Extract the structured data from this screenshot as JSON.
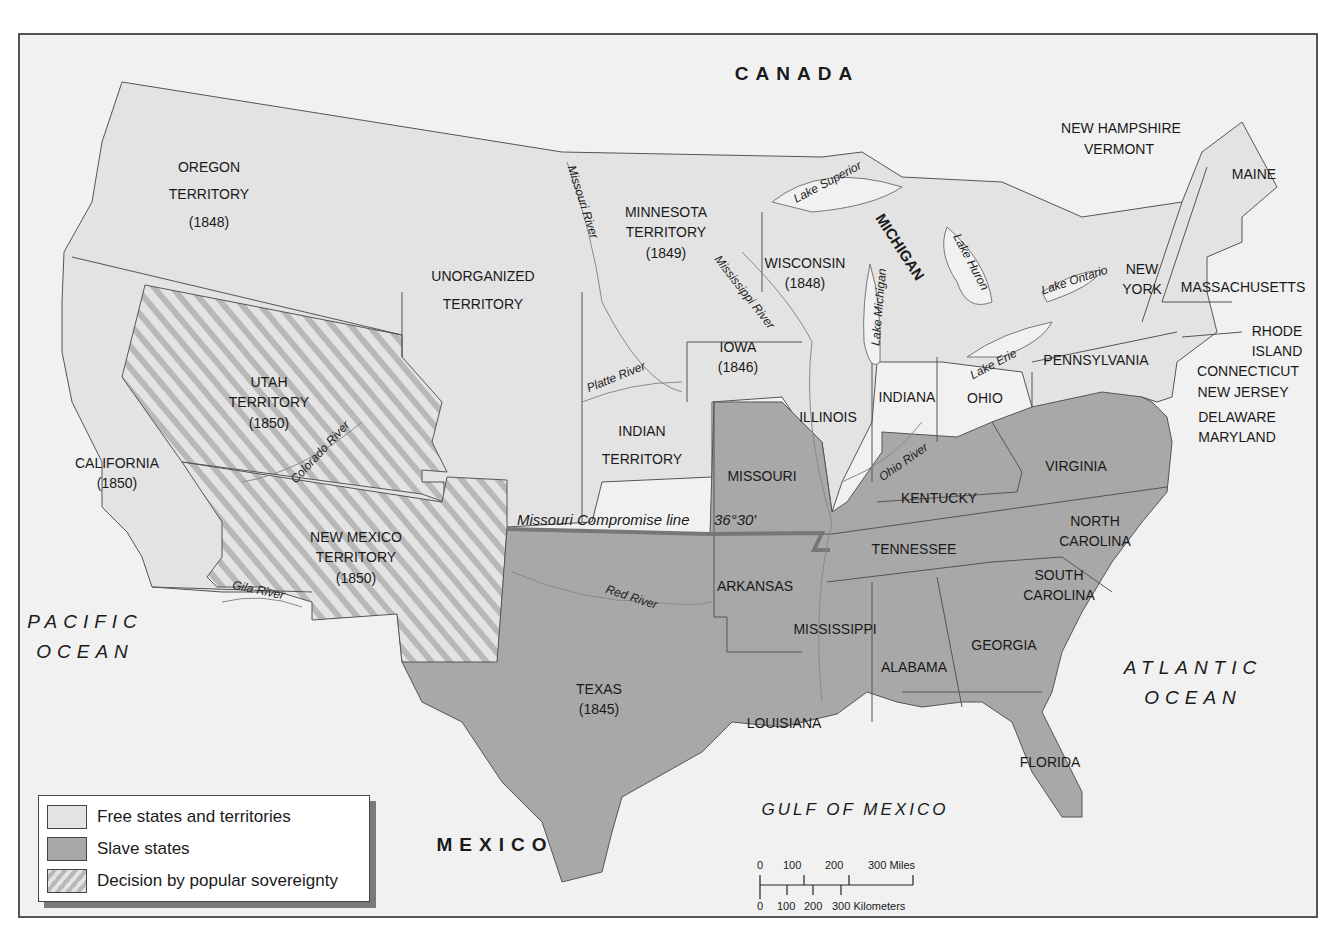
{
  "colors": {
    "free": "#e3e3e3",
    "slave": "#a8a8a8",
    "popular_sovereignty_base": "#e3e3e3",
    "popular_sovereignty_stripe": "#b5b5b5",
    "foreign_and_water": "#f1f1f1",
    "border": "#444444",
    "compromise_line": "#777777"
  },
  "countries": {
    "canada": "CANADA",
    "mexico": "MEXICO"
  },
  "water_bodies": {
    "pacific": [
      "PACIFIC",
      "OCEAN"
    ],
    "atlantic": [
      "ATLANTIC",
      "OCEAN"
    ],
    "gulf": "GULF OF MEXICO"
  },
  "regions": {
    "oregon": {
      "name": "OREGON",
      "line2": "TERRITORY",
      "year": "(1848)",
      "status": "free"
    },
    "unorganized": {
      "name": "UNORGANIZED",
      "line2": "TERRITORY",
      "status": "free"
    },
    "minnesota": {
      "name": "MINNESOTA",
      "line2": "TERRITORY",
      "year": "(1849)",
      "status": "free"
    },
    "wisconsin": {
      "name": "WISCONSIN",
      "year": "(1848)",
      "status": "free"
    },
    "michigan": {
      "name": "MICHIGAN",
      "status": "free"
    },
    "iowa": {
      "name": "IOWA",
      "year": "(1846)",
      "status": "free"
    },
    "utah": {
      "name": "UTAH",
      "line2": "TERRITORY",
      "year": "(1850)",
      "status": "popular_sovereignty"
    },
    "new_mexico": {
      "name": "NEW MEXICO",
      "line2": "TERRITORY",
      "year": "(1850)",
      "status": "popular_sovereignty"
    },
    "california": {
      "name": "CALIFORNIA",
      "year": "(1850)",
      "status": "free"
    },
    "indian": {
      "name": "INDIAN",
      "line2": "TERRITORY",
      "status": "free"
    },
    "illinois": {
      "name": "ILLINOIS",
      "status": "free"
    },
    "indiana": {
      "name": "INDIANA",
      "status": "free"
    },
    "ohio": {
      "name": "OHIO",
      "status": "free"
    },
    "pennsylvania": {
      "name": "PENNSYLVANIA",
      "status": "free"
    },
    "new_york": {
      "name": "NEW",
      "line2": "YORK",
      "status": "free"
    },
    "new_hampshire": {
      "name": "NEW HAMPSHIRE",
      "status": "free"
    },
    "vermont": {
      "name": "VERMONT",
      "status": "free"
    },
    "maine": {
      "name": "MAINE",
      "status": "free"
    },
    "massachusetts": {
      "name": "MASSACHUSETTS",
      "status": "free"
    },
    "rhode_island": {
      "name": "RHODE",
      "line2": "ISLAND",
      "status": "free"
    },
    "connecticut": {
      "name": "CONNECTICUT",
      "status": "free"
    },
    "new_jersey": {
      "name": "NEW JERSEY",
      "status": "free"
    },
    "delaware": {
      "name": "DELAWARE",
      "status": "slave"
    },
    "maryland": {
      "name": "MARYLAND",
      "status": "slave"
    },
    "missouri": {
      "name": "MISSOURI",
      "status": "slave"
    },
    "kentucky": {
      "name": "KENTUCKY",
      "status": "slave"
    },
    "virginia": {
      "name": "VIRGINIA",
      "status": "slave"
    },
    "tennessee": {
      "name": "TENNESSEE",
      "status": "slave"
    },
    "north_carolina": {
      "name": "NORTH",
      "line2": "CAROLINA",
      "status": "slave"
    },
    "south_carolina": {
      "name": "SOUTH",
      "line2": "CAROLINA",
      "status": "slave"
    },
    "arkansas": {
      "name": "ARKANSAS",
      "status": "slave"
    },
    "mississippi": {
      "name": "MISSISSIPPI",
      "status": "slave"
    },
    "alabama": {
      "name": "ALABAMA",
      "status": "slave"
    },
    "georgia": {
      "name": "GEORGIA",
      "status": "slave"
    },
    "louisiana": {
      "name": "LOUISIANA",
      "status": "slave"
    },
    "florida": {
      "name": "FLORIDA",
      "status": "slave"
    },
    "texas": {
      "name": "TEXAS",
      "year": "(1845)",
      "status": "slave"
    }
  },
  "rivers": {
    "missouri": "Missouri River",
    "mississippi": "Mississippi River",
    "platte": "Platte River",
    "colorado": "Colorado River",
    "gila": "Gila River",
    "red": "Red River",
    "ohio": "Ohio River"
  },
  "lakes": {
    "superior": "Lake Superior",
    "michigan": "Lake Michigan",
    "huron": "Lake Huron",
    "erie": "Lake Erie",
    "ontario": "Lake Ontario"
  },
  "compromise_line": {
    "label": "Missouri Compromise line",
    "latitude": "36°30'"
  },
  "legend": {
    "items": [
      {
        "label": "Free states and territories",
        "type": "free"
      },
      {
        "label": "Slave states",
        "type": "slave"
      },
      {
        "label": "Decision by popular sovereignty",
        "type": "popular_sovereignty"
      }
    ]
  },
  "scale": {
    "miles_ticks": [
      "0",
      "100",
      "200",
      "300 Miles"
    ],
    "km_ticks": [
      "0",
      "100",
      "200",
      "300 Kilometers"
    ]
  }
}
